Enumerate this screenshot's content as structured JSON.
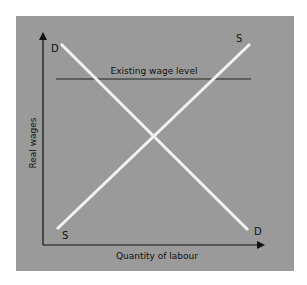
{
  "diagram": {
    "type": "supply-demand",
    "background": "#9a9a9a",
    "curve_color": "#f2f2f2",
    "axes": {
      "x_label": "Quantity of labour",
      "y_label": "Real wages"
    },
    "curves": [
      {
        "name": "demand",
        "start_label": "D",
        "end_label": "D"
      },
      {
        "name": "supply",
        "start_label": "S",
        "end_label": "S"
      }
    ],
    "reference_line": {
      "label": "Existing wage level"
    }
  }
}
